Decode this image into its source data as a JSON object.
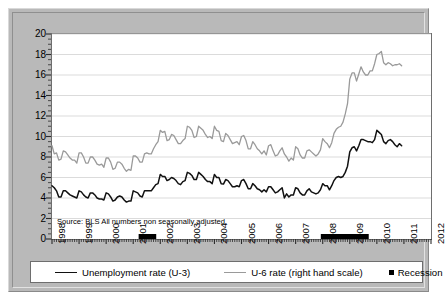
{
  "figure": {
    "panel_color": "#b9b9b9",
    "plot_background": "#ffffff",
    "source_note": "Source: BLS All numbers non seasonally adjusted."
  },
  "legend": {
    "items": [
      {
        "label": "Unemployment rate (U-3)",
        "marker": "line",
        "color": "#111111"
      },
      {
        "label": "U-6 rate (right hand scale)",
        "marker": "line",
        "color": "#9a9a9a"
      },
      {
        "label": "Recession",
        "marker": "square",
        "color": "#000000"
      }
    ]
  },
  "chart_data": {
    "type": "line",
    "title": "",
    "subtitle": "",
    "xlabel": "",
    "ylabel": "",
    "grid": true,
    "legend_position": "bottom",
    "annotations": [
      "Source: BLS All numbers non seasonally adjusted."
    ],
    "xlim": [
      1998.0,
      2012.0
    ],
    "ylim": [
      0,
      20
    ],
    "yticks": [
      0,
      2,
      4,
      6,
      8,
      10,
      12,
      14,
      16,
      18,
      20
    ],
    "ytick_labels": [
      "0",
      "2",
      "4",
      "6",
      "8",
      "10",
      "12",
      "14",
      "16",
      "18",
      "20"
    ],
    "y_minor_tick_step": 0.5,
    "xticks": [
      1998,
      1999,
      2000,
      2001,
      2002,
      2003,
      2004,
      2005,
      2006,
      2007,
      2008,
      2009,
      2010,
      2011,
      2012
    ],
    "xtick_labels": [
      "1998",
      "1999",
      "2000",
      "2001",
      "2002",
      "2003",
      "2004",
      "2005",
      "2006",
      "2007",
      "2008",
      "2009",
      "2010",
      "2011",
      "2012"
    ],
    "x_minor_tick_step": 0.0833,
    "x_step": 0.08333,
    "x_start": 1998.0,
    "series": [
      {
        "name": "Unemployment rate (U-3)",
        "color": "#111111",
        "width": 1.5,
        "values": [
          5.2,
          5.0,
          4.7,
          4.1,
          4.1,
          4.7,
          4.7,
          4.5,
          4.3,
          4.2,
          4.1,
          4.0,
          4.7,
          4.6,
          4.3,
          4.1,
          4.0,
          4.5,
          4.5,
          4.3,
          4.0,
          3.9,
          3.9,
          3.8,
          4.5,
          4.4,
          4.1,
          3.7,
          3.8,
          4.1,
          4.2,
          4.1,
          3.8,
          3.6,
          3.7,
          3.7,
          4.7,
          4.6,
          4.5,
          4.2,
          4.1,
          4.7,
          4.7,
          4.7,
          4.7,
          5.0,
          5.3,
          5.4,
          6.3,
          6.1,
          6.1,
          5.7,
          5.8,
          6.0,
          5.9,
          5.7,
          5.4,
          5.3,
          5.6,
          5.7,
          6.5,
          6.4,
          6.2,
          5.8,
          5.8,
          6.5,
          6.3,
          6.1,
          5.8,
          5.6,
          5.6,
          5.4,
          6.3,
          6.0,
          6.0,
          5.4,
          5.36,
          5.8,
          5.7,
          5.4,
          5.1,
          5.1,
          5.2,
          5.1,
          5.7,
          5.8,
          5.4,
          4.9,
          4.9,
          5.4,
          5.2,
          4.9,
          4.8,
          4.6,
          4.8,
          4.6,
          5.1,
          5.1,
          4.8,
          4.5,
          4.6,
          4.8,
          5.0,
          4.008,
          4.4,
          4.1,
          4.3,
          4.3,
          5.0,
          4.9,
          4.5,
          4.3,
          4.3,
          4.7,
          4.9,
          4.6,
          4.5,
          4.4,
          4.5,
          4.8,
          5.4,
          5.2,
          5.2,
          4.8,
          5.2,
          5.7,
          6.0,
          6.1,
          6.0,
          6.1,
          6.5,
          7.1,
          8.5,
          8.9,
          9.0,
          8.6,
          9.1,
          9.7,
          9.7,
          9.6,
          9.5,
          9.5,
          9.4,
          9.7,
          10.6,
          10.4,
          10.2,
          9.5,
          9.3,
          9.6,
          9.7,
          9.5,
          9.2,
          9.0,
          9.3,
          9.1
        ]
      },
      {
        "name": "U-6 rate (right hand scale)",
        "color": "#9a9a9a",
        "width": 1.3,
        "values": [
          9.1,
          8.3,
          8.4,
          7.7,
          7.8,
          8.6,
          8.5,
          8.2,
          7.9,
          7.7,
          7.7,
          7.4,
          8.4,
          8.4,
          8.0,
          7.4,
          7.4,
          8.0,
          8.0,
          7.7,
          7.3,
          7.2,
          7.3,
          7.0,
          7.9,
          7.9,
          7.5,
          6.8,
          6.9,
          7.5,
          7.5,
          7.3,
          6.9,
          6.6,
          6.8,
          6.7,
          8.1,
          8.1,
          7.9,
          7.5,
          7.5,
          8.3,
          8.4,
          8.3,
          8.3,
          8.8,
          9.2,
          9.5,
          10.6,
          10.4,
          10.5,
          9.6,
          9.7,
          10.2,
          10.1,
          9.7,
          9.3,
          9.3,
          9.6,
          9.8,
          11.0,
          10.9,
          10.6,
          9.9,
          10.0,
          11.0,
          10.8,
          10.6,
          10.2,
          9.9,
          10.0,
          9.8,
          11.0,
          10.6,
          10.5,
          9.6,
          9.5,
          10.3,
          10.1,
          9.7,
          9.3,
          9.4,
          9.5,
          9.2,
          10.0,
          10.1,
          9.6,
          8.8,
          8.8,
          9.5,
          9.2,
          8.8,
          8.6,
          8.3,
          8.6,
          8.2,
          9.1,
          9.2,
          8.6,
          8.1,
          8.2,
          8.6,
          8.9,
          8.3,
          8.0,
          7.6,
          7.9,
          7.7,
          9.0,
          8.8,
          8.2,
          7.9,
          7.9,
          8.6,
          8.7,
          8.5,
          8.3,
          8.1,
          8.3,
          8.7,
          9.8,
          9.5,
          9.3,
          8.9,
          9.4,
          10.3,
          10.7,
          10.9,
          11.0,
          11.4,
          12.2,
          13.2,
          15.6,
          16.2,
          16.2,
          15.4,
          16.1,
          16.8,
          16.3,
          16.0,
          16.0,
          16.4,
          16.4,
          17.1,
          18.0,
          18.1,
          18.3,
          17.2,
          17.0,
          17.2,
          17.1,
          16.9,
          17.0,
          17.0,
          17.1,
          16.9
        ]
      }
    ],
    "recessions": [
      {
        "start": 2001.2,
        "end": 2001.85
      },
      {
        "start": 2007.93,
        "end": 2009.7
      }
    ]
  }
}
